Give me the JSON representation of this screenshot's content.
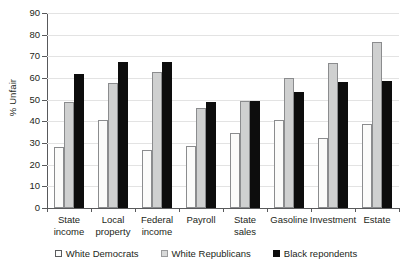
{
  "chart_data": {
    "type": "bar",
    "title": "",
    "xlabel": "",
    "ylabel": "% Unfair",
    "ylim": [
      0,
      90
    ],
    "ytick_step": 10,
    "grid": true,
    "legend_position": "bottom",
    "categories": [
      "State\nincome",
      "Local\nproperty",
      "Federal\nincome",
      "Payroll",
      "State\nsales",
      "Gasoline",
      "Investment",
      "Estate"
    ],
    "yticks": [
      "0",
      "10",
      "20",
      "30",
      "40",
      "50",
      "60",
      "70",
      "80",
      "90"
    ],
    "series": [
      {
        "name": "White Democrats",
        "color": "#fbfbfa",
        "values": [
          28,
          40.5,
          27,
          28.5,
          34.5,
          40.5,
          32.5,
          39
        ]
      },
      {
        "name": "White Republicans",
        "color": "#cfd0d0",
        "values": [
          49,
          57.5,
          63,
          46,
          49.5,
          60,
          67,
          76.5
        ]
      },
      {
        "name": "Black repondents",
        "color": "#0d0d0d",
        "values": [
          62,
          67.5,
          67.5,
          49,
          49.5,
          53.5,
          58,
          58.5
        ]
      }
    ]
  },
  "legend": {
    "items": [
      {
        "label": "White Democrats",
        "swatch": "white-square-icon"
      },
      {
        "label": "White Republicans",
        "swatch": "gray-square-icon"
      },
      {
        "label": "Black repondents",
        "swatch": "black-square-icon"
      }
    ]
  },
  "axes": {
    "y_title": "% Unfair"
  }
}
